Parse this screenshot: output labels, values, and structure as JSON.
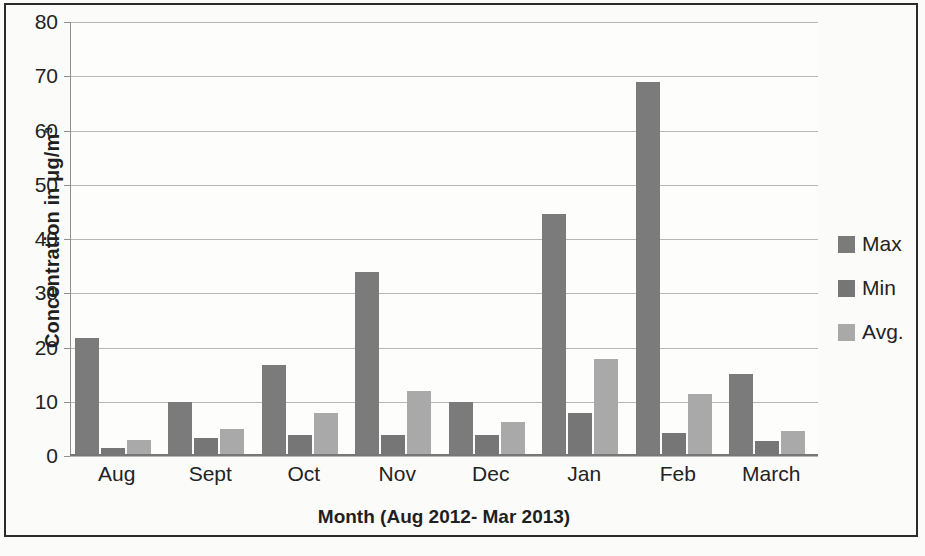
{
  "chart_data": {
    "type": "bar",
    "title": "",
    "xlabel": "Month (Aug 2012- Mar 2013)",
    "ylabel": "Concentration in μg/m³",
    "categories": [
      "Aug",
      "Sept",
      "Oct",
      "Nov",
      "Dec",
      "Jan",
      "Feb",
      "March"
    ],
    "series": [
      {
        "name": "Max",
        "values": [
          21.8,
          10.0,
          16.8,
          34.0,
          9.9,
          44.7,
          69.0,
          15.2
        ],
        "color": "#7b7b7b"
      },
      {
        "name": "Min",
        "values": [
          1.4,
          3.4,
          3.8,
          3.9,
          3.9,
          8.0,
          4.3,
          2.8
        ],
        "color": "#767676"
      },
      {
        "name": "Avg.",
        "values": [
          2.9,
          5.0,
          8.0,
          11.9,
          6.3,
          17.8,
          11.4,
          4.7
        ],
        "color": "#a9a9a9"
      }
    ],
    "ylim": [
      0,
      80
    ],
    "ytick_labels": [
      "80",
      "70",
      "60",
      "50",
      "40",
      "30",
      "20",
      "10",
      "0"
    ],
    "ytick_values": [
      80,
      70,
      60,
      50,
      40,
      30,
      20,
      10,
      0
    ],
    "grid": true,
    "legend_position": "right"
  },
  "legend": {
    "entries": [
      {
        "label": "Max",
        "color": "#7b7b7b"
      },
      {
        "label": "Min",
        "color": "#767676"
      },
      {
        "label": "Avg.",
        "color": "#a9a9a9"
      }
    ]
  }
}
